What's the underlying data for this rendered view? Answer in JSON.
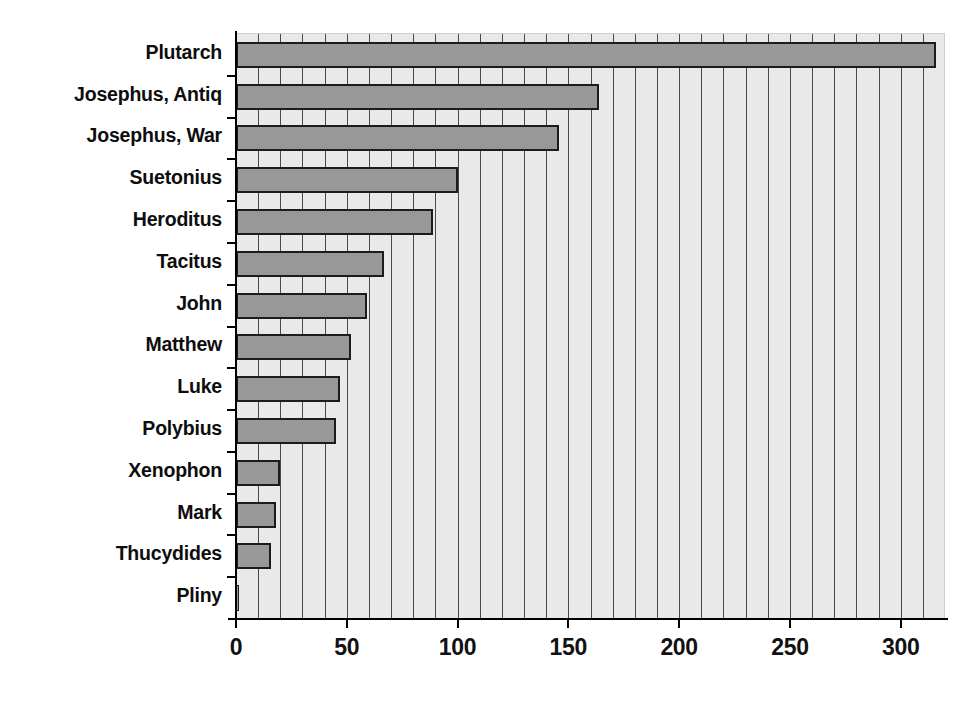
{
  "chart_data": {
    "type": "bar",
    "orientation": "horizontal",
    "title": "",
    "subtitle": "",
    "xlabel": "",
    "ylabel": "",
    "grid": "vertical-only",
    "legend": "none",
    "xlim": [
      0,
      320
    ],
    "xticks": [
      0,
      50,
      100,
      150,
      200,
      250,
      300
    ],
    "xtick_labels": [
      "0",
      "50",
      "100",
      "150",
      "200",
      "250",
      "300"
    ],
    "minor_gridline_step": 10,
    "categories": [
      "Plutarch",
      "Josephus, Antiq",
      "Josephus, War",
      "Suetonius",
      "Heroditus",
      "Tacitus",
      "John",
      "Matthew",
      "Luke",
      "Polybius",
      "Xenophon",
      "Mark",
      "Thucydides",
      "Pliny"
    ],
    "values": [
      316,
      164,
      146,
      100,
      89,
      67,
      59,
      52,
      47,
      45,
      20,
      18,
      16,
      1
    ],
    "colors": {
      "bar_fill": "#989898",
      "bar_edge": "#1c1c1c",
      "plot_background": "#e9e9e9",
      "gridline": "#4a4a4a",
      "axis": "#000000",
      "text": "#0d0d0d",
      "page_background": "#ffffff"
    }
  }
}
